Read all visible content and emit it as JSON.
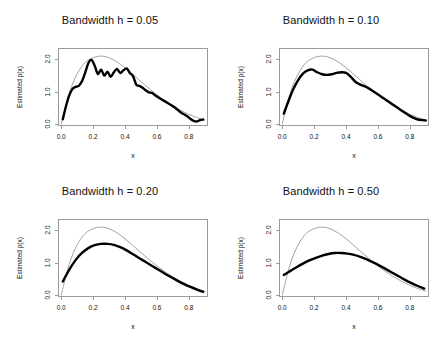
{
  "figure": {
    "axis_label_x": "x",
    "axis_label_y": "Estimated p(x)",
    "x_ticks": [
      "0.0",
      "0.2",
      "0.4",
      "0.6",
      "0.8"
    ],
    "y_ticks": [
      "0.0",
      "1.0",
      "2.0"
    ]
  },
  "chart_data": [
    {
      "type": "line",
      "title": "Bandwidth h = 0.05",
      "xlabel": "x",
      "ylabel": "Estimated p(x)",
      "xlim": [
        -0.02,
        0.92
      ],
      "ylim": [
        -0.06,
        2.35
      ],
      "xticks": [
        0.0,
        0.2,
        0.4,
        0.6,
        0.8
      ],
      "yticks": [
        0.0,
        1.0,
        2.0
      ],
      "grid": false,
      "legend": "none",
      "series": [
        {
          "name": "true density",
          "style": "thin-gray",
          "color": "#8c8c8c",
          "x": [
            0.0,
            0.05,
            0.1,
            0.15,
            0.2,
            0.25,
            0.3,
            0.35,
            0.4,
            0.45,
            0.5,
            0.55,
            0.6,
            0.65,
            0.7,
            0.75,
            0.8,
            0.85,
            0.9
          ],
          "values": [
            0.0,
            0.95,
            1.55,
            1.9,
            2.05,
            2.1,
            2.05,
            1.92,
            1.74,
            1.53,
            1.31,
            1.1,
            0.9,
            0.72,
            0.56,
            0.42,
            0.3,
            0.2,
            0.12
          ]
        },
        {
          "name": "kernel density estimate",
          "style": "thick-black",
          "color": "#000000",
          "x": [
            0.01,
            0.03,
            0.05,
            0.07,
            0.09,
            0.11,
            0.13,
            0.15,
            0.17,
            0.19,
            0.21,
            0.23,
            0.25,
            0.27,
            0.29,
            0.31,
            0.33,
            0.35,
            0.37,
            0.39,
            0.41,
            0.43,
            0.45,
            0.47,
            0.49,
            0.51,
            0.53,
            0.55,
            0.57,
            0.59,
            0.61,
            0.63,
            0.65,
            0.67,
            0.69,
            0.71,
            0.73,
            0.75,
            0.77,
            0.79,
            0.81,
            0.83,
            0.85,
            0.87,
            0.89
          ],
          "values": [
            0.15,
            0.55,
            0.88,
            1.08,
            1.15,
            1.18,
            1.32,
            1.58,
            1.88,
            1.98,
            1.8,
            1.55,
            1.68,
            1.5,
            1.62,
            1.46,
            1.6,
            1.7,
            1.58,
            1.66,
            1.72,
            1.58,
            1.48,
            1.22,
            1.18,
            1.12,
            1.04,
            0.98,
            0.96,
            0.88,
            0.82,
            0.76,
            0.7,
            0.64,
            0.58,
            0.52,
            0.44,
            0.36,
            0.3,
            0.24,
            0.16,
            0.1,
            0.08,
            0.12,
            0.14
          ]
        }
      ]
    },
    {
      "type": "line",
      "title": "Bandwidth h = 0.10",
      "xlabel": "x",
      "ylabel": "Estimated p(x)",
      "xlim": [
        -0.02,
        0.92
      ],
      "ylim": [
        -0.06,
        2.35
      ],
      "xticks": [
        0.0,
        0.2,
        0.4,
        0.6,
        0.8
      ],
      "yticks": [
        0.0,
        1.0,
        2.0
      ],
      "grid": false,
      "legend": "none",
      "series": [
        {
          "name": "true density",
          "style": "thin-gray",
          "color": "#8c8c8c",
          "x": [
            0.0,
            0.05,
            0.1,
            0.15,
            0.2,
            0.25,
            0.3,
            0.35,
            0.4,
            0.45,
            0.5,
            0.55,
            0.6,
            0.65,
            0.7,
            0.75,
            0.8,
            0.85,
            0.9
          ],
          "values": [
            0.0,
            0.95,
            1.55,
            1.9,
            2.05,
            2.1,
            2.05,
            1.92,
            1.74,
            1.53,
            1.31,
            1.1,
            0.9,
            0.72,
            0.56,
            0.42,
            0.3,
            0.2,
            0.12
          ]
        },
        {
          "name": "kernel density estimate",
          "style": "thick-black",
          "color": "#000000",
          "x": [
            0.01,
            0.04,
            0.07,
            0.1,
            0.13,
            0.16,
            0.19,
            0.22,
            0.25,
            0.28,
            0.31,
            0.34,
            0.37,
            0.4,
            0.43,
            0.46,
            0.49,
            0.52,
            0.55,
            0.58,
            0.61,
            0.64,
            0.67,
            0.7,
            0.73,
            0.76,
            0.79,
            0.82,
            0.85,
            0.88,
            0.9
          ],
          "values": [
            0.32,
            0.72,
            1.08,
            1.36,
            1.56,
            1.66,
            1.68,
            1.6,
            1.54,
            1.52,
            1.54,
            1.58,
            1.6,
            1.58,
            1.46,
            1.3,
            1.22,
            1.16,
            1.08,
            0.98,
            0.88,
            0.78,
            0.68,
            0.58,
            0.48,
            0.38,
            0.28,
            0.2,
            0.14,
            0.12,
            0.11
          ]
        }
      ]
    },
    {
      "type": "line",
      "title": "Bandwidth h = 0.20",
      "xlabel": "x",
      "ylabel": "Estimated p(x)",
      "xlim": [
        -0.02,
        0.92
      ],
      "ylim": [
        -0.06,
        2.35
      ],
      "xticks": [
        0.0,
        0.2,
        0.4,
        0.6,
        0.8
      ],
      "yticks": [
        0.0,
        1.0,
        2.0
      ],
      "grid": false,
      "legend": "none",
      "series": [
        {
          "name": "true density",
          "style": "thin-gray",
          "color": "#8c8c8c",
          "x": [
            0.0,
            0.05,
            0.1,
            0.15,
            0.2,
            0.25,
            0.3,
            0.35,
            0.4,
            0.45,
            0.5,
            0.55,
            0.6,
            0.65,
            0.7,
            0.75,
            0.8,
            0.85,
            0.9
          ],
          "values": [
            0.0,
            0.95,
            1.55,
            1.9,
            2.05,
            2.1,
            2.05,
            1.92,
            1.74,
            1.53,
            1.31,
            1.1,
            0.9,
            0.72,
            0.56,
            0.42,
            0.3,
            0.2,
            0.12
          ]
        },
        {
          "name": "kernel density estimate",
          "style": "thick-black",
          "color": "#000000",
          "x": [
            0.01,
            0.05,
            0.09,
            0.13,
            0.17,
            0.21,
            0.25,
            0.29,
            0.33,
            0.37,
            0.41,
            0.45,
            0.49,
            0.53,
            0.57,
            0.61,
            0.65,
            0.69,
            0.73,
            0.77,
            0.81,
            0.85,
            0.89
          ],
          "values": [
            0.42,
            0.78,
            1.08,
            1.3,
            1.45,
            1.54,
            1.58,
            1.58,
            1.55,
            1.48,
            1.38,
            1.26,
            1.14,
            1.02,
            0.9,
            0.78,
            0.66,
            0.55,
            0.44,
            0.34,
            0.25,
            0.17,
            0.1
          ]
        }
      ]
    },
    {
      "type": "line",
      "title": "Bandwidth h = 0.50",
      "xlabel": "x",
      "ylabel": "Estimated p(x)",
      "xlim": [
        -0.02,
        0.92
      ],
      "ylim": [
        -0.06,
        2.35
      ],
      "xticks": [
        0.0,
        0.2,
        0.4,
        0.6,
        0.8
      ],
      "yticks": [
        0.0,
        1.0,
        2.0
      ],
      "grid": false,
      "legend": "none",
      "series": [
        {
          "name": "true density",
          "style": "thin-gray",
          "color": "#8c8c8c",
          "x": [
            0.0,
            0.05,
            0.1,
            0.15,
            0.2,
            0.25,
            0.3,
            0.35,
            0.4,
            0.45,
            0.5,
            0.55,
            0.6,
            0.65,
            0.7,
            0.75,
            0.8,
            0.85,
            0.9
          ],
          "values": [
            0.0,
            0.95,
            1.55,
            1.9,
            2.05,
            2.1,
            2.05,
            1.92,
            1.74,
            1.53,
            1.31,
            1.1,
            0.9,
            0.72,
            0.56,
            0.42,
            0.3,
            0.2,
            0.12
          ]
        },
        {
          "name": "kernel density estimate",
          "style": "thick-black",
          "color": "#000000",
          "x": [
            0.01,
            0.05,
            0.09,
            0.13,
            0.17,
            0.21,
            0.25,
            0.29,
            0.33,
            0.37,
            0.41,
            0.45,
            0.49,
            0.53,
            0.57,
            0.61,
            0.65,
            0.69,
            0.73,
            0.77,
            0.81,
            0.85,
            0.89
          ],
          "values": [
            0.62,
            0.74,
            0.86,
            0.97,
            1.07,
            1.15,
            1.22,
            1.27,
            1.3,
            1.3,
            1.28,
            1.24,
            1.18,
            1.1,
            1.01,
            0.91,
            0.8,
            0.69,
            0.58,
            0.47,
            0.37,
            0.28,
            0.2
          ]
        }
      ]
    }
  ]
}
